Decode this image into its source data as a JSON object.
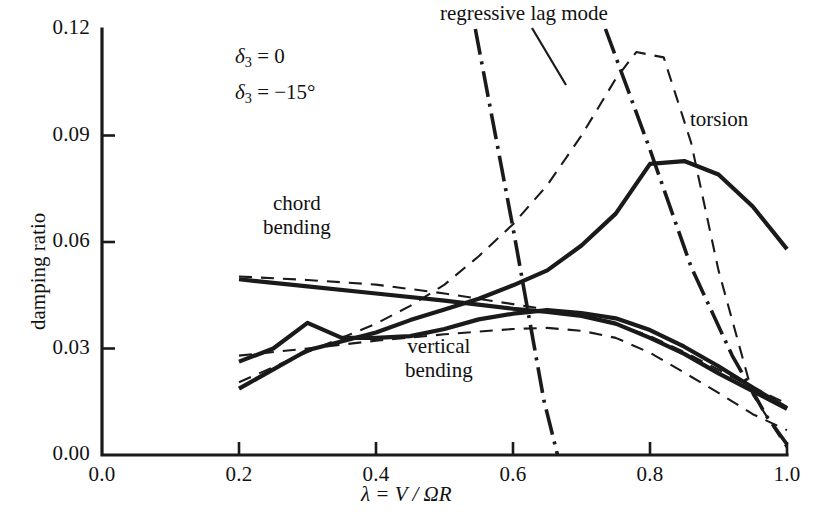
{
  "chart_data": {
    "type": "line",
    "title": "",
    "xlabel": "λ = V / ΩR",
    "ylabel": "damping ratio",
    "xlim": [
      0.0,
      1.0
    ],
    "ylim": [
      0.0,
      0.12
    ],
    "xticks": [
      "0.0",
      "0.2",
      "0.4",
      "0.6",
      "0.8",
      "1.0"
    ],
    "xtick_values": [
      0.0,
      0.2,
      0.4,
      0.6,
      0.8,
      1.0
    ],
    "yticks": [
      "0.00",
      "0.03",
      "0.06",
      "0.09",
      "0.12"
    ],
    "ytick_values": [
      0.0,
      0.03,
      0.06,
      0.09,
      0.12
    ],
    "grid": false,
    "legend_position": "top-center",
    "legend": [
      {
        "label_prefix": "δ",
        "label_sub": "3",
        "label_suffix": "= 0",
        "style": "solid"
      },
      {
        "label_prefix": "δ",
        "label_sub": "3",
        "label_suffix": "= −15°",
        "style": "dashed"
      }
    ],
    "annotations": [
      {
        "name": "regressive-lag-mode",
        "text": "regressive lag mode",
        "x": 0.63,
        "y": 0.128
      },
      {
        "name": "torsion",
        "text": "torsion",
        "x": 0.88,
        "y": 0.098
      },
      {
        "name": "chord-bending",
        "text": "chord\nbending",
        "x": 0.335,
        "y": 0.074
      },
      {
        "name": "vertical-bending",
        "text": "vertical\nbending",
        "x": 0.5,
        "y": 0.0235
      }
    ],
    "series": [
      {
        "name": "torsion δ₃ = 0",
        "mode": "torsion",
        "style": "solid",
        "x": [
          0.2,
          0.3,
          0.4,
          0.45,
          0.5,
          0.55,
          0.6,
          0.65,
          0.7,
          0.75,
          0.8,
          0.85,
          0.9,
          0.95,
          1.0
        ],
        "y": [
          0.0187,
          0.0295,
          0.0345,
          0.038,
          0.041,
          0.044,
          0.0478,
          0.052,
          0.059,
          0.068,
          0.082,
          0.0828,
          0.079,
          0.07,
          0.058
        ]
      },
      {
        "name": "chord bending δ₃ = 0",
        "mode": "chord-bending",
        "style": "solid",
        "x": [
          0.2,
          0.3,
          0.4,
          0.5,
          0.6,
          0.65,
          0.7,
          0.75,
          0.8,
          0.85,
          0.9,
          0.95,
          1.0
        ],
        "y": [
          0.0495,
          0.0475,
          0.0455,
          0.0435,
          0.0412,
          0.0403,
          0.0392,
          0.037,
          0.033,
          0.0285,
          0.023,
          0.018,
          0.013
        ]
      },
      {
        "name": "vertical bending δ₃ = 0",
        "mode": "vertical-bending",
        "style": "solid",
        "x": [
          0.2,
          0.25,
          0.3,
          0.35,
          0.4,
          0.45,
          0.5,
          0.55,
          0.6,
          0.65,
          0.7,
          0.75,
          0.8,
          0.85,
          0.9,
          0.95,
          1.0
        ],
        "y": [
          0.0263,
          0.03,
          0.0372,
          0.033,
          0.033,
          0.0335,
          0.0355,
          0.0382,
          0.0398,
          0.0408,
          0.04,
          0.0385,
          0.0352,
          0.0305,
          0.025,
          0.019,
          0.0132
        ]
      },
      {
        "name": "torsion δ₃ = −15°",
        "mode": "torsion",
        "style": "dashed",
        "x": [
          0.2,
          0.3,
          0.4,
          0.45,
          0.5,
          0.55,
          0.6,
          0.65,
          0.7,
          0.75,
          0.78,
          0.82,
          0.86,
          0.9,
          0.95,
          1.0
        ],
        "y": [
          0.0205,
          0.029,
          0.037,
          0.042,
          0.048,
          0.056,
          0.065,
          0.076,
          0.09,
          0.106,
          0.1135,
          0.112,
          0.088,
          0.052,
          0.017,
          0.002
        ]
      },
      {
        "name": "chord bending δ₃ = −15°",
        "mode": "chord-bending",
        "style": "dashed",
        "x": [
          0.2,
          0.3,
          0.4,
          0.5,
          0.6,
          0.65,
          0.7,
          0.75,
          0.8,
          0.85,
          0.9,
          0.95,
          1.0
        ],
        "y": [
          0.0503,
          0.0493,
          0.048,
          0.0455,
          0.0425,
          0.041,
          0.0392,
          0.0368,
          0.0335,
          0.029,
          0.024,
          0.019,
          0.0145
        ]
      },
      {
        "name": "vertical bending δ₃ = −15°",
        "mode": "vertical-bending",
        "style": "dashed",
        "x": [
          0.2,
          0.3,
          0.4,
          0.5,
          0.6,
          0.65,
          0.7,
          0.75,
          0.8,
          0.85,
          0.9,
          0.95,
          1.0
        ],
        "y": [
          0.028,
          0.03,
          0.0322,
          0.034,
          0.0355,
          0.0358,
          0.035,
          0.033,
          0.0288,
          0.0232,
          0.0175,
          0.0115,
          0.007
        ]
      },
      {
        "name": "regressive lag mode",
        "mode": "regressive-lag-mode",
        "style": "dash-dot",
        "x": [
          0.545,
          0.6,
          0.645,
          0.665
        ],
        "y": [
          0.12,
          0.064,
          0.0155,
          0.0
        ]
      },
      {
        "name": "regressive lag mode branch 2",
        "mode": "regressive-lag-mode",
        "style": "dash-dot",
        "x": [
          0.735,
          0.8,
          0.86,
          0.92,
          0.97,
          1.0
        ],
        "y": [
          0.12,
          0.086,
          0.053,
          0.028,
          0.011,
          0.003
        ]
      }
    ]
  },
  "colors": {
    "ink": "#1a1a1a",
    "background": "#ffffff"
  }
}
